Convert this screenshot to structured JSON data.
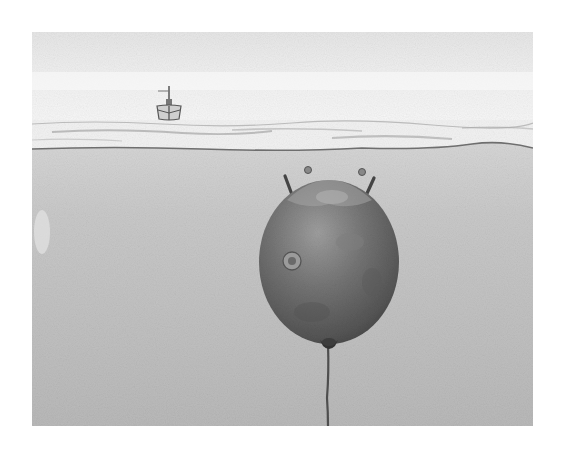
{
  "illustration": {
    "alt": "Pencil illustration of a moored naval contact mine floating underwater beneath a ship on the surface",
    "subjects": [
      "ship",
      "sea-surface",
      "naval-mine",
      "mooring-cable"
    ],
    "colors": {
      "page_bg": "#ffffff",
      "sky": "#ececec",
      "sky_band": "#f6f6f6",
      "surface_foam": "#f4f4f4",
      "waterline": "#6e6e6e",
      "water": "#bdbdbd",
      "water_light": "#d2d2d2",
      "mine_body": "#6f6f6f",
      "mine_dark": "#4a4a4a",
      "mine_highlight": "#9a9a9a",
      "cable": "#4e4e4e",
      "ship": "#555555"
    }
  }
}
